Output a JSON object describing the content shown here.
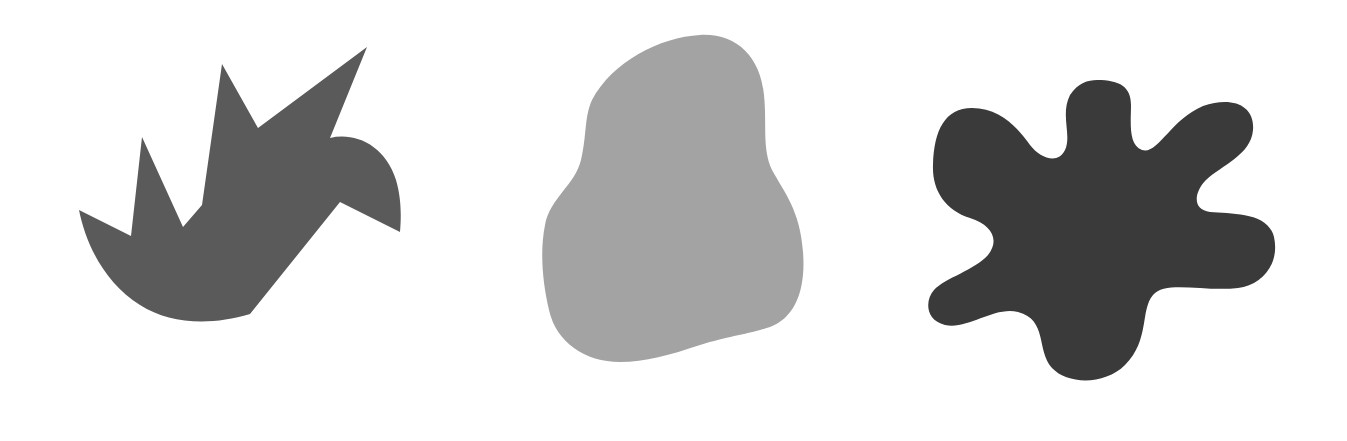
{
  "scene": {
    "background": "#ffffff",
    "width": 1347,
    "height": 441
  },
  "shapes": [
    {
      "label": "angular-bird-shape",
      "kind": "polygon-with-curves",
      "fill": "#5a5a5a",
      "path": "M79,210 L131,236 L142,137 L183,227 L202,205 L222,64 L258,128 L367,47 L330,138 C355,132 385,145 396,180 C402,200 401,220 400,232 L340,202 L250,314 L223,394 L250,314 C210,326 170,324 140,305 C105,283 86,245 79,210 Z"
    },
    {
      "label": "rounded-blob-shape",
      "kind": "smooth-blob",
      "fill": "#a3a3a3",
      "path": "M700,35 C735,33 760,55 764,95 C767,125 762,148 772,170 C784,192 800,210 803,252 C806,290 795,318 770,327 C745,335 730,336 700,345 C670,355 645,362 620,362 C585,362 556,342 549,310 C542,280 540,250 545,225 C550,198 575,185 581,160 C587,135 584,118 592,100 C612,62 660,37 700,35 Z"
    },
    {
      "label": "splat-blob-shape",
      "kind": "smooth-blob",
      "fill": "#3a3a3a",
      "path": "M1097,80 C1120,80 1131,87 1131,105 C1131,122 1128,145 1142,150 C1158,155 1170,120 1203,106 C1232,96 1255,105 1253,130 C1251,155 1222,165 1206,180 C1194,192 1192,210 1210,212 C1232,214 1268,212 1274,237 C1280,264 1262,285 1238,288 C1205,292 1165,280 1153,295 C1140,310 1150,340 1125,365 C1105,385 1068,385 1052,368 C1036,350 1048,320 1018,312 C994,306 968,330 945,325 C925,320 925,300 934,290 C945,278 975,270 988,255 C1000,240 992,225 970,218 C945,210 932,190 933,165 C934,130 945,108 972,108 C1000,108 1018,128 1030,145 C1040,158 1058,165 1065,150 C1072,135 1060,115 1070,95 C1078,83 1088,80 1097,80 Z"
    }
  ]
}
